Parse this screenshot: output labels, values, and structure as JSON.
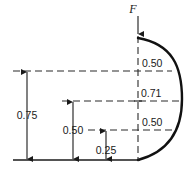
{
  "figure": {
    "force": {
      "label": "F",
      "direction": "down",
      "name": "applied-force"
    },
    "dimensions": {
      "left_overall": "0.75",
      "middle": "0.50",
      "small": "0.25",
      "upper_right": "0.50",
      "centroid": "0.71",
      "lower_right": "0.50"
    },
    "colors": {
      "ink": "#1a1a1a",
      "arc": "#111111",
      "dashed": "#2a2a2a",
      "background": "#ffffff"
    }
  }
}
